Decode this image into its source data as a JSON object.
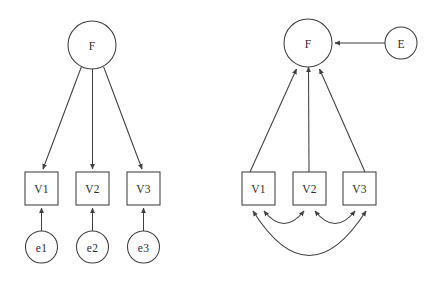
{
  "figure": {
    "title": "",
    "background_color": "#ffffff",
    "line_color": "#3f3f3f",
    "node_fill": "#ffffff",
    "label_color": "#2e2e2e",
    "width": 440,
    "height": 281,
    "panel_count": 2
  },
  "left_panel": {
    "name": "reflective-measurement-model",
    "caption": "",
    "factor": {
      "id": "F-left",
      "label": "F",
      "shape": "circle",
      "cx": 92,
      "cy": 45,
      "r": 24
    },
    "indicators": [
      {
        "id": "V1-left",
        "label": "V1",
        "shape": "rect",
        "x": 25,
        "y": 172,
        "w": 33,
        "h": 33,
        "cx": 41.5,
        "cy": 188.5
      },
      {
        "id": "V2-left",
        "label": "V2",
        "shape": "rect",
        "x": 76,
        "y": 172,
        "w": 33,
        "h": 33,
        "cx": 92.5,
        "cy": 188.5
      },
      {
        "id": "V3-left",
        "label": "V3",
        "shape": "rect",
        "x": 127,
        "y": 172,
        "w": 33,
        "h": 33,
        "cx": 143.5,
        "cy": 188.5
      }
    ],
    "errors": [
      {
        "id": "e1",
        "label": "e1",
        "shape": "circle",
        "cx": 41.5,
        "cy": 247,
        "r": 16
      },
      {
        "id": "e2",
        "label": "e2",
        "shape": "circle",
        "cx": 92.5,
        "cy": 247,
        "r": 16
      },
      {
        "id": "e3",
        "label": "e3",
        "shape": "circle",
        "cx": 143.5,
        "cy": 247,
        "r": 16
      }
    ],
    "edges": [
      {
        "id": "F-to-V1",
        "from": "F",
        "to": "V1",
        "type": "single-headed-arrow",
        "direction": "factor-to-indicator"
      },
      {
        "id": "F-to-V2",
        "from": "F",
        "to": "V2",
        "type": "single-headed-arrow",
        "direction": "factor-to-indicator"
      },
      {
        "id": "F-to-V3",
        "from": "F",
        "to": "V3",
        "type": "single-headed-arrow",
        "direction": "factor-to-indicator"
      },
      {
        "id": "e1-to-V1",
        "from": "e1",
        "to": "V1",
        "type": "single-headed-arrow",
        "direction": "error-to-indicator"
      },
      {
        "id": "e2-to-V2",
        "from": "e2",
        "to": "V2",
        "type": "single-headed-arrow",
        "direction": "error-to-indicator"
      },
      {
        "id": "e3-to-V3",
        "from": "e3",
        "to": "V3",
        "type": "single-headed-arrow",
        "direction": "error-to-indicator"
      }
    ]
  },
  "right_panel": {
    "name": "formative-composite-model",
    "caption": "",
    "factor": {
      "id": "F-right",
      "label": "F",
      "shape": "circle",
      "cx": 308,
      "cy": 43,
      "r": 24
    },
    "disturbance": {
      "id": "E",
      "label": "E",
      "shape": "circle",
      "cx": 401,
      "cy": 43,
      "r": 16
    },
    "indicators": [
      {
        "id": "V1-right",
        "label": "V1",
        "shape": "rect",
        "x": 242,
        "y": 172,
        "w": 33,
        "h": 33,
        "cx": 258.5,
        "cy": 188.5
      },
      {
        "id": "V2-right",
        "label": "V2",
        "shape": "rect",
        "x": 293,
        "y": 172,
        "w": 33,
        "h": 33,
        "cx": 309.5,
        "cy": 188.5
      },
      {
        "id": "V3-right",
        "label": "V3",
        "shape": "rect",
        "x": 343,
        "y": 172,
        "w": 33,
        "h": 33,
        "cx": 359.5,
        "cy": 188.5
      }
    ],
    "edges": [
      {
        "id": "V1-to-F",
        "from": "V1",
        "to": "F",
        "type": "single-headed-arrow",
        "direction": "indicator-to-factor"
      },
      {
        "id": "V2-to-F",
        "from": "V2",
        "to": "F",
        "type": "single-headed-arrow",
        "direction": "indicator-to-factor"
      },
      {
        "id": "V3-to-F",
        "from": "V3",
        "to": "F",
        "type": "single-headed-arrow",
        "direction": "indicator-to-factor"
      },
      {
        "id": "E-to-F",
        "from": "E",
        "to": "F",
        "type": "single-headed-arrow",
        "direction": "disturbance-to-factor"
      }
    ],
    "correlations": [
      {
        "id": "V1-V2-corr",
        "between": [
          "V1",
          "V2"
        ],
        "type": "double-headed-curve",
        "arc": "small"
      },
      {
        "id": "V2-V3-corr",
        "between": [
          "V2",
          "V3"
        ],
        "type": "double-headed-curve",
        "arc": "small"
      },
      {
        "id": "V1-V3-corr",
        "between": [
          "V1",
          "V3"
        ],
        "type": "double-headed-curve",
        "arc": "large"
      }
    ]
  }
}
